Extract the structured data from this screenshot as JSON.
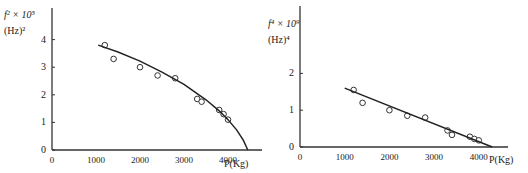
{
  "chart_data": [
    {
      "type": "scatter",
      "title": "",
      "ylabel": "f^2 × 10^5 (Hz)^2",
      "ylabel_lines": [
        "f² × 10⁵",
        "(Hz)²"
      ],
      "xlabel": "P(Kg)",
      "xlim": [
        0,
        4700
      ],
      "ylim": [
        0,
        4.9
      ],
      "x_ticks": [
        0,
        1000,
        2000,
        3000,
        4000
      ],
      "y_ticks": [
        0,
        1,
        2,
        3,
        4
      ],
      "grid": false,
      "legend": null,
      "series": [
        {
          "name": "measured",
          "marker": "open-circle",
          "x": [
            1200,
            1400,
            2000,
            2400,
            2800,
            3300,
            3400,
            3800,
            3900,
            4000
          ],
          "y": [
            3.8,
            3.3,
            3.0,
            2.7,
            2.6,
            1.85,
            1.75,
            1.45,
            1.3,
            1.1
          ]
        },
        {
          "name": "fit",
          "style": "line",
          "x": [
            1050,
            1500,
            2000,
            2500,
            3000,
            3500,
            3800,
            4000,
            4200,
            4350,
            4450
          ],
          "y": [
            3.8,
            3.55,
            3.22,
            2.82,
            2.38,
            1.82,
            1.42,
            1.1,
            0.72,
            0.35,
            0.0
          ]
        }
      ]
    },
    {
      "type": "scatter",
      "title": "",
      "ylabel": "f^4 × 10^9 (Hz)^4",
      "ylabel_lines": [
        "f⁴ × 10⁹",
        "(Hz)⁴"
      ],
      "xlabel": "P(Kg)",
      "xlim": [
        0,
        4700
      ],
      "ylim": [
        0,
        3.9
      ],
      "x_ticks": [
        0,
        1000,
        2000,
        3000,
        4000
      ],
      "y_ticks": [
        0,
        1,
        2
      ],
      "grid": false,
      "legend": null,
      "series": [
        {
          "name": "measured",
          "marker": "open-circle",
          "x": [
            1200,
            1400,
            2000,
            2400,
            2800,
            3300,
            3400,
            3800,
            3900,
            4000
          ],
          "y": [
            1.55,
            1.2,
            1.0,
            0.85,
            0.8,
            0.45,
            0.33,
            0.28,
            0.22,
            0.18
          ]
        },
        {
          "name": "fit",
          "style": "line",
          "x": [
            1000,
            4300
          ],
          "y": [
            1.6,
            0.0
          ]
        }
      ]
    }
  ]
}
